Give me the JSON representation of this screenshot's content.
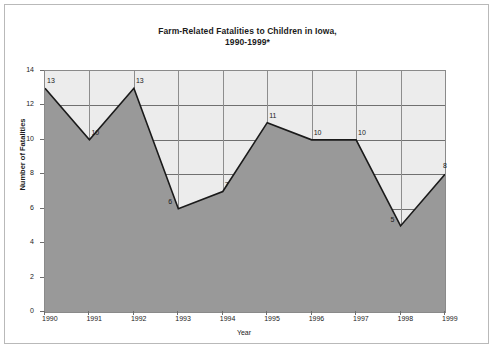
{
  "figure": {
    "title_line1": "Farm-Related Fatalities to Children in Iowa,",
    "title_line2": "1990-1999*"
  },
  "chart_data": {
    "type": "area",
    "title": "Farm-Related Fatalities to Children in Iowa, 1990-1999*",
    "xlabel": "Year",
    "ylabel": "Number of Fatalities",
    "categories": [
      "1990",
      "1991",
      "1992",
      "1993",
      "1994",
      "1995",
      "1996",
      "1997",
      "1998",
      "1999"
    ],
    "values": [
      13,
      10,
      13,
      6,
      7,
      11,
      10,
      10,
      5,
      8
    ],
    "point_labels": [
      "13",
      "10",
      "13",
      "6",
      "7",
      "11",
      "10",
      "10",
      "5",
      "8"
    ],
    "ylim": [
      0,
      14
    ],
    "yticks": [
      "0",
      "2",
      "4",
      "6",
      "8",
      "10",
      "12",
      "14"
    ],
    "ytick_values": [
      0,
      2,
      4,
      6,
      8,
      10,
      12,
      14
    ],
    "grid": true,
    "legend": "none",
    "colors": {
      "area_fill": "#999999",
      "plot_background": "#ececec",
      "line": "#1a1a1a",
      "gridline": "#707070",
      "axis": "#8a8a8a",
      "text": "#1b1b1b"
    }
  }
}
